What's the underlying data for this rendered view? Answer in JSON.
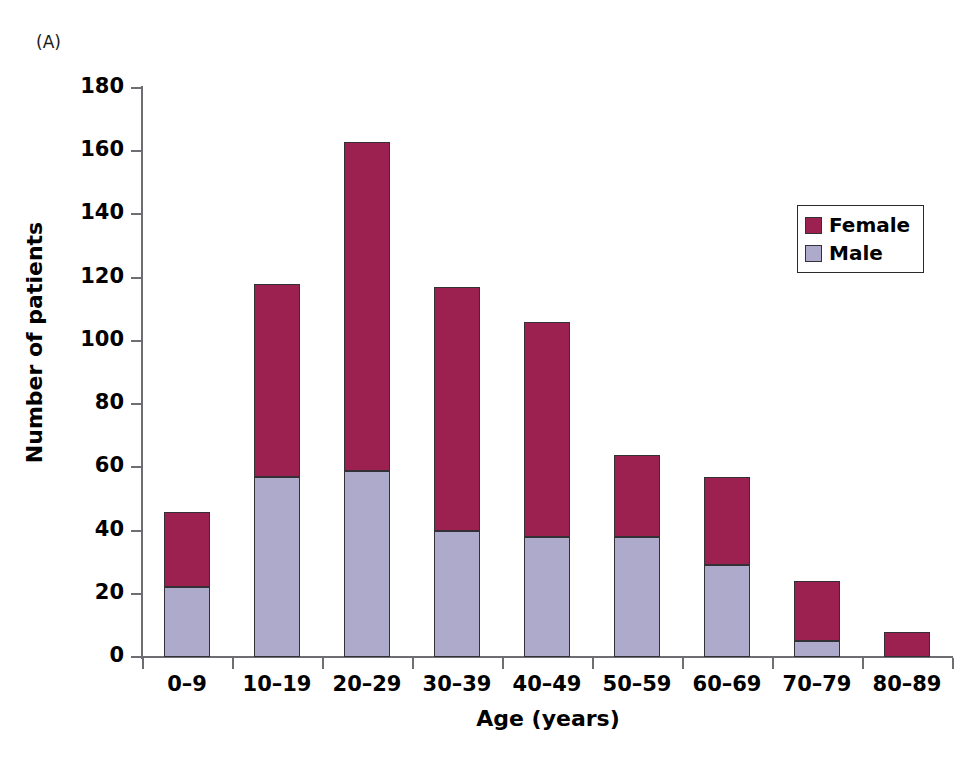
{
  "panel_label": "(A)",
  "chart_data": {
    "type": "bar",
    "subtype": "stacked-vertical",
    "title": "",
    "xlabel": "Age (years)",
    "ylabel": "Number of patients",
    "categories": [
      "0–9",
      "10–19",
      "20–29",
      "30–39",
      "40–49",
      "50–59",
      "60–69",
      "70–79",
      "80–89"
    ],
    "series": [
      {
        "name": "Male",
        "color": "#adaacb",
        "values": [
          22,
          57,
          59,
          40,
          38,
          38,
          29,
          5,
          0
        ]
      },
      {
        "name": "Female",
        "color": "#9c2050",
        "values": [
          24,
          61,
          104,
          77,
          68,
          26,
          28,
          19,
          8
        ]
      }
    ],
    "totals": [
      46,
      118,
      163,
      117,
      106,
      64,
      57,
      24,
      8
    ],
    "ylim": [
      0,
      180
    ],
    "yticks": [
      0,
      20,
      40,
      60,
      80,
      100,
      120,
      140,
      160,
      180
    ],
    "ytick_labels": [
      "0",
      "20",
      "40",
      "60",
      "80",
      "100",
      "120",
      "140",
      "160",
      "180"
    ],
    "grid": false,
    "legend_position": "top-right",
    "legend_entries": [
      "Female",
      "Male"
    ],
    "stack_order": [
      "Male",
      "Female"
    ]
  },
  "legend": {
    "items": [
      {
        "label": "Female",
        "color": "#9c2050"
      },
      {
        "label": "Male",
        "color": "#adaacb"
      }
    ]
  },
  "colors": {
    "female": "#9c2050",
    "male": "#adaacb",
    "axis": "#6e6e72",
    "bar_outline": "#333036",
    "background": "#ffffff"
  }
}
